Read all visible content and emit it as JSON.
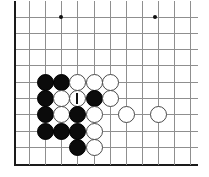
{
  "figure": {
    "name": "go-board-diagram",
    "type": "go-board-position",
    "width": 209,
    "height": 177,
    "background_color": "#ffffff"
  },
  "board": {
    "grid_color": "#8f8f8f",
    "edge_color": "#1a1a1a",
    "left_edge_x": 14,
    "right_extent_x": 198,
    "top_line_y": 17,
    "bottom_edge_y": 165,
    "column_x": [
      14,
      29,
      45,
      61,
      77,
      94,
      110,
      126,
      142,
      158,
      174,
      190
    ],
    "row_y": [
      17,
      33,
      49,
      65,
      82,
      98,
      114,
      131,
      147,
      165
    ],
    "spacing": 16.3,
    "stone_diameter": 17,
    "edges": {
      "left": true,
      "bottom": true,
      "top": false,
      "right": false
    },
    "star_points": [
      {
        "x": 61,
        "y": 17
      },
      {
        "x": 155,
        "y": 17
      }
    ]
  },
  "stones": [
    {
      "color": "black",
      "x": 45,
      "y": 82,
      "marked": false
    },
    {
      "color": "black",
      "x": 61,
      "y": 82,
      "marked": false
    },
    {
      "color": "white",
      "x": 77,
      "y": 82,
      "marked": false
    },
    {
      "color": "white",
      "x": 94,
      "y": 82,
      "marked": false
    },
    {
      "color": "white",
      "x": 110,
      "y": 82,
      "marked": false
    },
    {
      "color": "black",
      "x": 45,
      "y": 98,
      "marked": false
    },
    {
      "color": "white",
      "x": 61,
      "y": 98,
      "marked": false
    },
    {
      "color": "white",
      "x": 77,
      "y": 98,
      "marked": true
    },
    {
      "color": "black",
      "x": 94,
      "y": 98,
      "marked": false
    },
    {
      "color": "white",
      "x": 110,
      "y": 98,
      "marked": false
    },
    {
      "color": "black",
      "x": 45,
      "y": 114,
      "marked": false
    },
    {
      "color": "white",
      "x": 61,
      "y": 114,
      "marked": false
    },
    {
      "color": "black",
      "x": 77,
      "y": 114,
      "marked": false
    },
    {
      "color": "white",
      "x": 94,
      "y": 114,
      "marked": false
    },
    {
      "color": "white",
      "x": 126,
      "y": 114,
      "marked": false
    },
    {
      "color": "white",
      "x": 158,
      "y": 114,
      "marked": false
    },
    {
      "color": "black",
      "x": 45,
      "y": 131,
      "marked": false
    },
    {
      "color": "black",
      "x": 61,
      "y": 131,
      "marked": false
    },
    {
      "color": "black",
      "x": 77,
      "y": 131,
      "marked": false
    },
    {
      "color": "white",
      "x": 94,
      "y": 131,
      "marked": false
    },
    {
      "color": "black",
      "x": 77,
      "y": 147,
      "marked": false
    },
    {
      "color": "white",
      "x": 94,
      "y": 147,
      "marked": false
    }
  ],
  "mark": {
    "type": "vertical-bar",
    "color": "#101010",
    "width": 2,
    "height": 11
  }
}
